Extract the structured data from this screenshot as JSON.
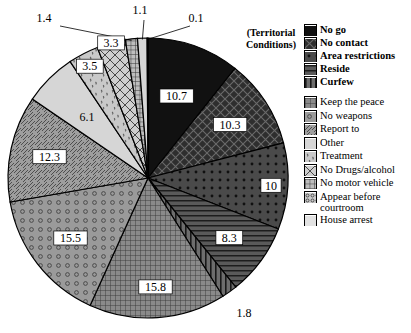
{
  "legend": {
    "heading": "(Territorial Conditions)",
    "group1": [
      {
        "label": "No go",
        "pattern": "solid-black",
        "value": 10.7
      },
      {
        "label": "No contact",
        "pattern": "dark-crosshatch",
        "value": 10.3
      },
      {
        "label": "Area restrictions",
        "pattern": "dark-dots",
        "value": 10
      },
      {
        "label": "Reside",
        "pattern": "horizontal-lines",
        "value": 8.3
      },
      {
        "label": "Curfew",
        "pattern": "vertical-lines",
        "value": 1.8
      }
    ],
    "group2": [
      {
        "label": "Keep the peace",
        "pattern": "fine-grid",
        "value": 15.8
      },
      {
        "label": "No weapons",
        "pattern": "circles",
        "value": 15.5
      },
      {
        "label": "Report to",
        "pattern": "diagonal-lines",
        "value": 12.3
      },
      {
        "label": "Other",
        "pattern": "light-solid",
        "value": 6.1
      },
      {
        "label": "Treatment",
        "pattern": "speckle",
        "value": 3.5
      },
      {
        "label": "No Drugs/alcohol",
        "pattern": "diamond-hatch",
        "value": 3.3
      },
      {
        "label": "No motor vehicle",
        "pattern": "small-checks",
        "value": 1.4
      },
      {
        "label": "Appear before\ncourtroom",
        "pattern": "tiny-grid",
        "value": 1.1
      },
      {
        "label": "House arrest",
        "pattern": "pale-solid",
        "value": 0.1
      }
    ]
  },
  "chart_data": {
    "type": "pie",
    "title": "",
    "legend_position": "right",
    "categories": [
      "No go",
      "No contact",
      "Area restrictions",
      "Reside",
      "Curfew",
      "Keep the peace",
      "No weapons",
      "Report to",
      "Other",
      "Treatment",
      "No Drugs/alcohol",
      "No motor vehicle",
      "Appear before courtroom",
      "House arrest"
    ],
    "values": [
      10.7,
      10.3,
      10,
      8.3,
      1.8,
      15.8,
      15.5,
      12.3,
      6.1,
      3.5,
      3.3,
      1.4,
      1.1,
      0.1
    ],
    "labels": [
      "10.7",
      "10.3",
      "10",
      "8.3",
      "1.8",
      "15.8",
      "15.5",
      "12.3",
      "6.1",
      "3.5",
      "3.3",
      "1.4",
      "1.1",
      "0.1"
    ],
    "units": "percent",
    "start_angle_deg": 0,
    "direction": "clockwise"
  },
  "colors": {
    "outline": "#000000",
    "text": "#000000",
    "background": "#ffffff"
  }
}
